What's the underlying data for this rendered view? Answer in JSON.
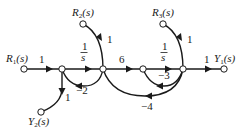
{
  "diagram": {
    "type": "signal-flow-graph",
    "nodes": [
      {
        "id": "R1",
        "label": "R1(s)",
        "main": "R",
        "sub": "1",
        "x": 24,
        "y": 69
      },
      {
        "id": "n2",
        "label": "",
        "x": 62,
        "y": 69
      },
      {
        "id": "n3",
        "label": "",
        "x": 103,
        "y": 69
      },
      {
        "id": "n4",
        "label": "",
        "x": 143,
        "y": 69
      },
      {
        "id": "n5",
        "label": "",
        "x": 183,
        "y": 69
      },
      {
        "id": "Y1",
        "label": "Y1(s)",
        "main": "Y",
        "sub": "1",
        "x": 224,
        "y": 69
      },
      {
        "id": "R2",
        "label": "R2(s)",
        "main": "R",
        "sub": "2",
        "x": 83,
        "y": 24
      },
      {
        "id": "R3",
        "label": "R3(s)",
        "main": "R",
        "sub": "3",
        "x": 163,
        "y": 24
      },
      {
        "id": "Y2",
        "label": "Y2(s)",
        "main": "Y",
        "sub": "2",
        "x": 41,
        "y": 112
      }
    ],
    "edges": [
      {
        "from": "R1",
        "to": "n2",
        "gain": "1"
      },
      {
        "from": "n2",
        "to": "n3",
        "gain": "1/s"
      },
      {
        "from": "n3",
        "to": "n4",
        "gain": "6"
      },
      {
        "from": "n4",
        "to": "n5",
        "gain": "1/s"
      },
      {
        "from": "n5",
        "to": "Y1",
        "gain": "1"
      },
      {
        "from": "R2",
        "to": "n3",
        "gain": "1"
      },
      {
        "from": "R3",
        "to": "n5",
        "gain": "1"
      },
      {
        "from": "n2",
        "to": "Y2",
        "gain": "1"
      },
      {
        "from": "n3",
        "to": "n2",
        "gain": "-2"
      },
      {
        "from": "n5",
        "to": "n4",
        "gain": "-3"
      },
      {
        "from": "n5",
        "to": "n3",
        "gain": "-4"
      }
    ],
    "labels": {
      "R1": "R",
      "R1_sub": "1",
      "R2": "R",
      "R2_sub": "2",
      "R3": "R",
      "R3_sub": "3",
      "Y1": "Y",
      "Y1_sub": "1",
      "Y2": "Y",
      "Y2_sub": "2",
      "s_arg": "(s)",
      "g_r1": "1",
      "g_int_num": "1",
      "g_int_den": "s",
      "g_6": "6",
      "g_y1": "1",
      "g_r2": "1",
      "g_r3": "1",
      "g_y2": "1",
      "g_m2": "−2",
      "g_m3": "−3",
      "g_m4": "−4"
    }
  }
}
